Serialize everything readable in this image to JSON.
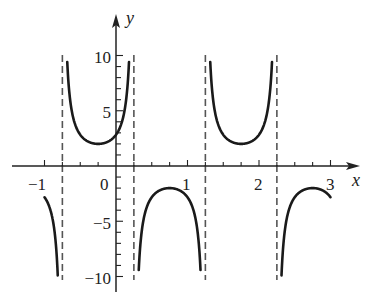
{
  "chart_data": {
    "type": "line",
    "title": "",
    "function": "y = 2 csc(pi*x + 3*pi/4)",
    "xlabel": "x",
    "ylabel": "y",
    "xlim": [
      -1,
      3
    ],
    "ylim": [
      -10,
      10
    ],
    "x_ticks": [
      -1,
      -0.75,
      -0.5,
      -0.25,
      0,
      0.25,
      0.5,
      0.75,
      1,
      1.25,
      1.5,
      1.75,
      2,
      2.25,
      2.5,
      2.75,
      3
    ],
    "x_tick_labels": [
      {
        "value": -1,
        "label": "−1"
      },
      {
        "value": 0,
        "label": "0"
      },
      {
        "value": 1,
        "label": "1"
      },
      {
        "value": 2,
        "label": "2"
      },
      {
        "value": 3,
        "label": "3"
      }
    ],
    "y_ticks": [
      -10,
      -9,
      -8,
      -7,
      -6,
      -5,
      -4,
      -3,
      -2,
      -1,
      1,
      2,
      3,
      4,
      5,
      6,
      7,
      8,
      9,
      10
    ],
    "y_tick_labels": [
      {
        "value": 10,
        "label": "10"
      },
      {
        "value": 5,
        "label": "5"
      },
      {
        "value": -5,
        "label": "−5"
      },
      {
        "value": -10,
        "label": "−10"
      }
    ],
    "asymptotes": [
      -0.75,
      0.25,
      1.25,
      2.25
    ],
    "branches": [
      {
        "domain": [
          -1,
          -0.75
        ],
        "direction": "down",
        "start_y": -2.83
      },
      {
        "domain": [
          -0.75,
          0.25
        ],
        "direction": "up",
        "local_min": {
          "x": -0.25,
          "y": 2
        }
      },
      {
        "domain": [
          0.25,
          1.25
        ],
        "direction": "down",
        "local_max": {
          "x": 0.75,
          "y": -2
        }
      },
      {
        "domain": [
          1.25,
          2.25
        ],
        "direction": "up",
        "local_min": {
          "x": 1.75,
          "y": 2
        }
      },
      {
        "domain": [
          2.25,
          3
        ],
        "direction": "down",
        "end_y": -2.83
      }
    ],
    "grid": false,
    "legend": null,
    "colors": {
      "curve": "#1a1a1a",
      "asymptote": "#555555",
      "axis": "#222222"
    }
  },
  "labels": {
    "x_axis": "x",
    "y_axis": "y",
    "xt_m1": "−1",
    "xt_0": "0",
    "xt_1": "1",
    "xt_2": "2",
    "xt_3": "3",
    "yt_10": "10",
    "yt_5": "5",
    "yt_m5": "−5",
    "yt_m10": "−10"
  }
}
